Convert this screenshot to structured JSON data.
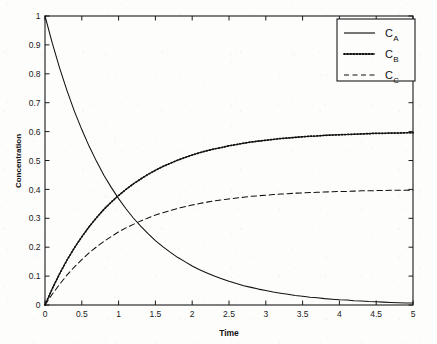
{
  "figure": {
    "background_color": "#fdfdfc",
    "axes_color": "#1a1a1a",
    "plot_box": {
      "left": 45,
      "top": 16,
      "right": 413,
      "bottom": 305
    }
  },
  "chart_data": {
    "type": "line",
    "title": "",
    "xlabel": "Time",
    "ylabel": "Concentration",
    "xlim": [
      0,
      5
    ],
    "ylim": [
      0,
      1
    ],
    "grid": false,
    "legend_position": "upper right",
    "xticks": [
      0,
      0.5,
      1,
      1.5,
      2,
      2.5,
      3,
      3.5,
      4,
      4.5,
      5
    ],
    "xticklabels": [
      "0",
      "0.5",
      "1",
      "1.5",
      "2",
      "2.5",
      "3",
      "3.5",
      "4",
      "4.5",
      "5"
    ],
    "yticks": [
      0,
      0.1,
      0.2,
      0.3,
      0.4,
      0.5,
      0.6,
      0.7,
      0.8,
      0.9,
      1
    ],
    "yticklabels": [
      "0",
      "0.1",
      "0.2",
      "0.3",
      "0.4",
      "0.5",
      "0.6",
      "0.7",
      "0.8",
      "0.9",
      "1"
    ],
    "x": [
      0,
      0.1,
      0.2,
      0.3,
      0.4,
      0.5,
      0.6,
      0.7,
      0.8,
      0.9,
      1.0,
      1.1,
      1.2,
      1.3,
      1.4,
      1.5,
      1.6,
      1.7,
      1.8,
      1.9,
      2.0,
      2.1,
      2.2,
      2.3,
      2.4,
      2.5,
      2.6,
      2.7,
      2.8,
      2.9,
      3.0,
      3.1,
      3.2,
      3.3,
      3.4,
      3.5,
      3.6,
      3.7,
      3.8,
      3.9,
      4.0,
      4.1,
      4.2,
      4.3,
      4.4,
      4.5,
      4.6,
      4.7,
      4.8,
      4.9,
      5.0
    ],
    "series": [
      {
        "name": "C_A",
        "label": "C",
        "sublabel": "A",
        "style": "solid",
        "color": "#111111",
        "values": [
          1.0,
          0.905,
          0.819,
          0.741,
          0.67,
          0.607,
          0.549,
          0.497,
          0.449,
          0.407,
          0.368,
          0.333,
          0.301,
          0.273,
          0.247,
          0.223,
          0.202,
          0.183,
          0.165,
          0.15,
          0.135,
          0.122,
          0.111,
          0.1,
          0.091,
          0.082,
          0.074,
          0.067,
          0.061,
          0.055,
          0.05,
          0.045,
          0.041,
          0.037,
          0.033,
          0.03,
          0.027,
          0.025,
          0.022,
          0.02,
          0.018,
          0.017,
          0.015,
          0.014,
          0.012,
          0.011,
          0.01,
          0.009,
          0.008,
          0.007,
          0.007
        ]
      },
      {
        "name": "C_B",
        "label": "C",
        "sublabel": "B",
        "style": "solid-dotted",
        "color": "#111111",
        "values": [
          0.0,
          0.057,
          0.109,
          0.156,
          0.198,
          0.236,
          0.271,
          0.302,
          0.331,
          0.356,
          0.379,
          0.4,
          0.419,
          0.436,
          0.452,
          0.466,
          0.479,
          0.49,
          0.501,
          0.51,
          0.519,
          0.527,
          0.534,
          0.54,
          0.545,
          0.551,
          0.555,
          0.56,
          0.564,
          0.567,
          0.57,
          0.573,
          0.576,
          0.578,
          0.58,
          0.582,
          0.584,
          0.585,
          0.587,
          0.588,
          0.589,
          0.59,
          0.591,
          0.592,
          0.593,
          0.594,
          0.594,
          0.595,
          0.595,
          0.596,
          0.596
        ]
      },
      {
        "name": "C_C",
        "label": "C",
        "sublabel": "C",
        "style": "dashed",
        "color": "#111111",
        "values": [
          0.0,
          0.038,
          0.072,
          0.104,
          0.132,
          0.157,
          0.181,
          0.201,
          0.22,
          0.237,
          0.253,
          0.267,
          0.279,
          0.291,
          0.301,
          0.311,
          0.319,
          0.327,
          0.334,
          0.34,
          0.346,
          0.351,
          0.356,
          0.36,
          0.364,
          0.367,
          0.37,
          0.373,
          0.376,
          0.378,
          0.38,
          0.382,
          0.384,
          0.385,
          0.387,
          0.388,
          0.389,
          0.39,
          0.391,
          0.392,
          0.393,
          0.393,
          0.394,
          0.395,
          0.395,
          0.396,
          0.396,
          0.397,
          0.397,
          0.397,
          0.398
        ]
      }
    ]
  }
}
